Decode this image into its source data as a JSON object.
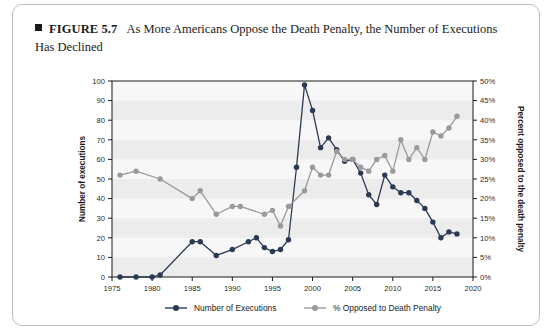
{
  "figure": {
    "bullet": "square-bullet",
    "label": "FIGURE 5.7",
    "title": "As More Americans Oppose the Death Penalty, the Number of Executions Has Declined"
  },
  "colors": {
    "executions": "#2b3a52",
    "opposed": "#9a9a9a",
    "band": "#ececec",
    "plot_background": "#f7f7f7",
    "axis": "#1a1a1a",
    "card_border": "#bdbdbd"
  },
  "axes": {
    "left_title": "Number of executions",
    "right_title": "Percent opposed to the death penalty",
    "x_title": "",
    "left_ticks": [
      "0",
      "10",
      "20",
      "30",
      "40",
      "50",
      "60",
      "70",
      "80",
      "90",
      "100"
    ],
    "right_ticks": [
      "0%",
      "5%",
      "10%",
      "15%",
      "20%",
      "25%",
      "30%",
      "35%",
      "40%",
      "45%",
      "50%"
    ],
    "x_ticks": [
      "1975",
      "1980",
      "1985",
      "1990",
      "1995",
      "2000",
      "2005",
      "2010",
      "2015",
      "2020"
    ]
  },
  "legend": {
    "items": [
      {
        "name": "legend-executions",
        "label": "Number of Executions",
        "color": "#2b3a52"
      },
      {
        "name": "legend-opposed",
        "label": "% Opposed to Death Penalty",
        "color": "#9a9a9a"
      }
    ]
  },
  "chart_data": {
    "type": "line",
    "title": "As More Americans Oppose the Death Penalty, the Number of Executions Has Declined",
    "xlabel": "",
    "ylabel": "Number of executions",
    "y2label": "Percent opposed to the death penalty",
    "xlim": [
      1975,
      2020
    ],
    "ylim": [
      0,
      100
    ],
    "y2lim": [
      0,
      50
    ],
    "grid": "horizontal-bands",
    "legend_position": "bottom",
    "series": [
      {
        "name": "Number of Executions",
        "axis": "left",
        "color": "#2b3a52",
        "points": [
          [
            1976,
            0
          ],
          [
            1978,
            0
          ],
          [
            1980,
            0
          ],
          [
            1981,
            1
          ],
          [
            1985,
            18
          ],
          [
            1986,
            18
          ],
          [
            1988,
            11
          ],
          [
            1990,
            14
          ],
          [
            1992,
            18
          ],
          [
            1993,
            20
          ],
          [
            1994,
            15
          ],
          [
            1995,
            13
          ],
          [
            1996,
            14
          ],
          [
            1997,
            19
          ],
          [
            1998,
            56
          ],
          [
            1999,
            98
          ],
          [
            2000,
            85
          ],
          [
            2001,
            66
          ],
          [
            2002,
            71
          ],
          [
            2003,
            65
          ],
          [
            2004,
            59
          ],
          [
            2005,
            60
          ],
          [
            2006,
            53
          ],
          [
            2007,
            42
          ],
          [
            2008,
            37
          ],
          [
            2009,
            52
          ],
          [
            2010,
            46
          ],
          [
            2011,
            43
          ],
          [
            2012,
            43
          ],
          [
            2013,
            39
          ],
          [
            2014,
            35
          ],
          [
            2015,
            28
          ],
          [
            2016,
            20
          ],
          [
            2017,
            23
          ],
          [
            2018,
            22
          ]
        ]
      },
      {
        "name": "% Opposed to Death Penalty",
        "axis": "right",
        "color": "#9a9a9a",
        "points": [
          [
            1976,
            26
          ],
          [
            1978,
            27
          ],
          [
            1981,
            25
          ],
          [
            1985,
            20
          ],
          [
            1986,
            22
          ],
          [
            1988,
            16
          ],
          [
            1990,
            18
          ],
          [
            1991,
            18
          ],
          [
            1994,
            16
          ],
          [
            1995,
            17
          ],
          [
            1996,
            13
          ],
          [
            1997,
            18
          ],
          [
            1999,
            22
          ],
          [
            2000,
            28
          ],
          [
            2001,
            26
          ],
          [
            2002,
            26
          ],
          [
            2003,
            32
          ],
          [
            2004,
            30
          ],
          [
            2005,
            30
          ],
          [
            2006,
            28
          ],
          [
            2007,
            27
          ],
          [
            2008,
            30
          ],
          [
            2009,
            31
          ],
          [
            2010,
            27
          ],
          [
            2011,
            35
          ],
          [
            2012,
            30
          ],
          [
            2013,
            33
          ],
          [
            2014,
            30
          ],
          [
            2015,
            37
          ],
          [
            2016,
            36
          ],
          [
            2017,
            38
          ],
          [
            2018,
            41
          ]
        ]
      }
    ]
  }
}
